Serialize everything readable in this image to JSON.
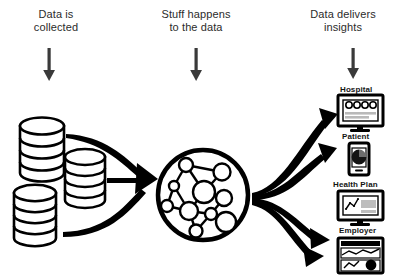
{
  "diagram": {
    "background_color": "#ffffff",
    "ink_color": "#000000",
    "arrow_color": "#3a3a3a"
  },
  "phases": [
    {
      "id": "collect",
      "label": "Data is\ncollected",
      "arrow": "down-arrow-icon"
    },
    {
      "id": "process",
      "label": "Stuff happens\nto the data",
      "arrow": "down-arrow-icon"
    },
    {
      "id": "deliver",
      "label": "Data delivers\ninsights",
      "arrow": "down-arrow-icon"
    }
  ],
  "sources": {
    "count": 3,
    "icon": "database-cylinder-icon",
    "items": [
      {
        "id": "db-1",
        "discs": 4
      },
      {
        "id": "db-2",
        "discs": 4
      },
      {
        "id": "db-3",
        "discs": 4
      }
    ]
  },
  "processor": {
    "icon": "network-graph-circle-icon",
    "node_count": 11,
    "description": "Network graph inside a heavy circular outline"
  },
  "outputs": [
    {
      "id": "hospital",
      "label": "Hospital",
      "icon": "desktop-monitor-gauges-icon"
    },
    {
      "id": "patient",
      "label": "Patient",
      "icon": "smartphone-pie-chart-icon"
    },
    {
      "id": "healthplan",
      "label": "Health Plan",
      "icon": "desktop-monitor-line-chart-icon"
    },
    {
      "id": "employer",
      "label": "Employer",
      "icon": "report-card-chart-icon"
    }
  ],
  "connectors": {
    "inflow_count": 3,
    "outflow_count": 4,
    "style": "curved-tapered-arrow"
  }
}
